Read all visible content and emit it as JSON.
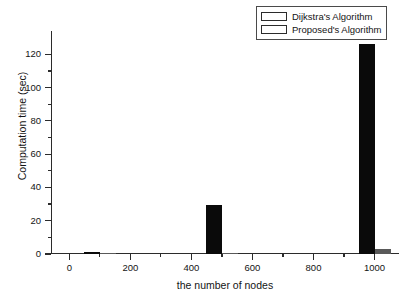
{
  "chart_data": {
    "type": "bar",
    "title": "",
    "xlabel": "the number of nodes",
    "ylabel": "Computation time (sec)",
    "categories": [
      100,
      500,
      1000
    ],
    "xlim": [
      -60,
      1080
    ],
    "ylim": [
      0,
      134
    ],
    "xticks": [
      0,
      200,
      400,
      600,
      800,
      1000
    ],
    "xtick_labels": [
      "0",
      "200",
      "400",
      "600",
      "800",
      "1000"
    ],
    "yticks": [
      0,
      20,
      40,
      60,
      80,
      100,
      120
    ],
    "ytick_labels": [
      "0",
      "20",
      "40",
      "60",
      "80",
      "100",
      "120"
    ],
    "grid": false,
    "legend_position": "top-right",
    "series": [
      {
        "name": "Dijkstra's Algorithm",
        "color": "#0a0a0a",
        "values": [
          1.5,
          29.5,
          126.0
        ]
      },
      {
        "name": "Proposed's Algorithm",
        "color": "#595959",
        "values": [
          0.2,
          0.8,
          3.0
        ]
      }
    ]
  },
  "legend": {
    "entries": [
      {
        "label": "Dijkstra's Algorithm",
        "color": "#0a0a0a"
      },
      {
        "label": "Proposed's Algorithm",
        "color": "#595959"
      }
    ]
  },
  "axes": {
    "x_title": "the number of nodes",
    "y_title": "Computation time (sec)"
  }
}
